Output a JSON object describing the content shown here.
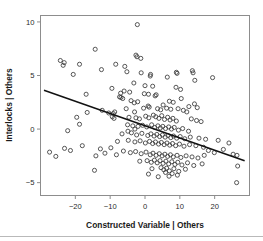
{
  "chart_data": {
    "type": "scatter",
    "title": "",
    "xlabel": "Constructed Variable | Others",
    "ylabel": "Interlocks | Others",
    "xlim": [
      -30,
      30
    ],
    "ylim": [
      -6.2,
      10.6
    ],
    "xticks": [
      -20,
      -10,
      0,
      10,
      20
    ],
    "xtick_labels": [
      "−20",
      "−10",
      "0",
      "10",
      "20"
    ],
    "yticks": [
      -5,
      0,
      5,
      10
    ],
    "ytick_labels": [
      "−5",
      "0",
      "5",
      "10"
    ],
    "grid": false,
    "legend": "none",
    "marker": "open-circle",
    "point_color": "#3a3a3a",
    "line_color": "#121212",
    "frame_color": "#8d8d8d",
    "fit_line": {
      "type": "linear",
      "label": "least-squares fit",
      "x_start": -29.0,
      "y_start": 3.62,
      "x_end": 28.6,
      "y_end": -2.95,
      "slope": -0.114,
      "intercept": 0.32
    },
    "points": [
      [
        -2.2,
        9.75
      ],
      [
        -14.3,
        7.45
      ],
      [
        -2.6,
        6.9
      ],
      [
        -2.3,
        6.75
      ],
      [
        -1.2,
        6.6
      ],
      [
        -24.3,
        6.4
      ],
      [
        -23.2,
        6.2
      ],
      [
        -18.8,
        6.05
      ],
      [
        -23.5,
        5.95
      ],
      [
        -8.4,
        6.05
      ],
      [
        -5.8,
        5.85
      ],
      [
        -12.5,
        5.55
      ],
      [
        -5.2,
        5.35
      ],
      [
        -20.6,
        5.1
      ],
      [
        -1.1,
        5.25
      ],
      [
        9.0,
        5.3
      ],
      [
        9.2,
        5.2
      ],
      [
        1.6,
        5.1
      ],
      [
        1.5,
        4.95
      ],
      [
        6.4,
        4.85
      ],
      [
        19.4,
        4.8
      ],
      [
        14.3,
        4.55
      ],
      [
        -3.2,
        4.3
      ],
      [
        -9.5,
        3.8
      ],
      [
        -16.9,
        3.25
      ],
      [
        -4.4,
        3.45
      ],
      [
        3.2,
        3.2
      ],
      [
        2.9,
        3.1
      ],
      [
        -7.3,
        3.0
      ],
      [
        -6.9,
        2.95
      ],
      [
        -6.4,
        2.85
      ],
      [
        -4.0,
        2.65
      ],
      [
        -2.1,
        2.55
      ],
      [
        -3.1,
        2.45
      ],
      [
        10.2,
        3.7
      ],
      [
        10.4,
        2.85
      ],
      [
        7.0,
        2.6
      ],
      [
        8.1,
        2.5
      ],
      [
        14.2,
        2.35
      ],
      [
        5.2,
        2.25
      ],
      [
        0.9,
        2.15
      ],
      [
        1.2,
        2.05
      ],
      [
        -0.4,
        1.95
      ],
      [
        -5.4,
        1.9
      ],
      [
        -12.3,
        1.75
      ],
      [
        -8.7,
        1.6
      ],
      [
        -9.1,
        1.45
      ],
      [
        -3.0,
        1.6
      ],
      [
        3.6,
        1.9
      ],
      [
        4.5,
        1.8
      ],
      [
        6.2,
        1.95
      ],
      [
        7.4,
        1.85
      ],
      [
        9.5,
        1.9
      ],
      [
        11.0,
        1.75
      ],
      [
        12.0,
        1.6
      ],
      [
        -19.6,
        1.1
      ],
      [
        -18.8,
        0.45
      ],
      [
        -22.2,
        -0.15
      ],
      [
        -10.4,
        1.5
      ],
      [
        -9.4,
        1.15
      ],
      [
        -8.9,
        1.0
      ],
      [
        -4.6,
        1.1
      ],
      [
        -2.6,
        1.05
      ],
      [
        -1.6,
        0.95
      ],
      [
        0.2,
        1.2
      ],
      [
        1.1,
        1.05
      ],
      [
        2.4,
        1.3
      ],
      [
        3.1,
        1.15
      ],
      [
        4.0,
        1.0
      ],
      [
        4.8,
        1.25
      ],
      [
        5.6,
        0.9
      ],
      [
        6.5,
        1.1
      ],
      [
        7.2,
        0.85
      ],
      [
        8.0,
        1.0
      ],
      [
        9.0,
        0.75
      ],
      [
        13.3,
        0.95
      ],
      [
        14.8,
        0.8
      ],
      [
        16.1,
        0.7
      ],
      [
        -5.0,
        0.4
      ],
      [
        -3.5,
        0.3
      ],
      [
        -2.0,
        0.25
      ],
      [
        -0.7,
        0.35
      ],
      [
        0.5,
        0.2
      ],
      [
        1.9,
        0.4
      ],
      [
        2.8,
        0.15
      ],
      [
        3.7,
        0.3
      ],
      [
        4.4,
        0.1
      ],
      [
        5.1,
        0.25
      ],
      [
        5.9,
        0.05
      ],
      [
        6.8,
        0.2
      ],
      [
        7.6,
        0.0
      ],
      [
        8.4,
        0.15
      ],
      [
        9.6,
        -0.1
      ],
      [
        10.8,
        0.05
      ],
      [
        12.5,
        -0.2
      ],
      [
        -6.6,
        -0.45
      ],
      [
        -3.9,
        -0.35
      ],
      [
        -2.4,
        -0.55
      ],
      [
        -0.9,
        -0.4
      ],
      [
        0.8,
        -0.6
      ],
      [
        1.7,
        -0.45
      ],
      [
        2.6,
        -0.65
      ],
      [
        3.4,
        -0.5
      ],
      [
        4.2,
        -0.7
      ],
      [
        5.0,
        -0.55
      ],
      [
        5.8,
        -0.75
      ],
      [
        6.6,
        -0.6
      ],
      [
        7.4,
        -0.8
      ],
      [
        8.2,
        -0.65
      ],
      [
        9.1,
        -0.85
      ],
      [
        10.1,
        -0.7
      ],
      [
        11.4,
        -0.9
      ],
      [
        13.0,
        -0.75
      ],
      [
        15.5,
        -0.85
      ],
      [
        17.4,
        -0.95
      ],
      [
        -7.9,
        -1.15
      ],
      [
        -4.8,
        -1.05
      ],
      [
        -2.9,
        -1.2
      ],
      [
        -1.4,
        -1.1
      ],
      [
        0.1,
        -1.3
      ],
      [
        1.3,
        -1.15
      ],
      [
        2.2,
        -1.35
      ],
      [
        3.0,
        -1.2
      ],
      [
        3.9,
        -1.4
      ],
      [
        4.7,
        -1.25
      ],
      [
        5.5,
        -1.45
      ],
      [
        6.3,
        -1.3
      ],
      [
        7.1,
        -1.5
      ],
      [
        7.9,
        -1.35
      ],
      [
        8.8,
        -1.55
      ],
      [
        9.9,
        -1.4
      ],
      [
        11.2,
        -1.6
      ],
      [
        12.8,
        -1.45
      ],
      [
        14.6,
        -1.55
      ],
      [
        16.8,
        -1.7
      ],
      [
        -27.4,
        -2.15
      ],
      [
        -25.6,
        -2.55
      ],
      [
        -23.1,
        -1.8
      ],
      [
        -21.4,
        -2.0
      ],
      [
        -18.0,
        -1.55
      ],
      [
        -14.1,
        -2.5
      ],
      [
        -12.8,
        -1.85
      ],
      [
        -9.8,
        -1.75
      ],
      [
        -8.2,
        -2.4
      ],
      [
        -6.2,
        -2.05
      ],
      [
        -4.2,
        -2.2
      ],
      [
        -2.7,
        -2.1
      ],
      [
        -1.1,
        -2.3
      ],
      [
        0.3,
        -2.15
      ],
      [
        1.5,
        -2.4
      ],
      [
        2.3,
        -2.25
      ],
      [
        3.2,
        -2.45
      ],
      [
        4.1,
        -2.3
      ],
      [
        4.9,
        -2.5
      ],
      [
        5.7,
        -2.35
      ],
      [
        6.5,
        -2.55
      ],
      [
        7.3,
        -2.4
      ],
      [
        8.1,
        -2.6
      ],
      [
        9.2,
        -2.45
      ],
      [
        10.3,
        -2.65
      ],
      [
        11.8,
        -2.5
      ],
      [
        13.5,
        -2.6
      ],
      [
        15.2,
        -2.7
      ],
      [
        17.0,
        -2.45
      ],
      [
        19.9,
        -2.2
      ],
      [
        25.3,
        -2.35
      ],
      [
        26.4,
        -2.45
      ],
      [
        -14.5,
        -3.85
      ],
      [
        -1.5,
        -3.0
      ],
      [
        0.6,
        -2.95
      ],
      [
        1.8,
        -3.1
      ],
      [
        2.7,
        -2.9
      ],
      [
        3.5,
        -3.15
      ],
      [
        4.3,
        -2.95
      ],
      [
        5.2,
        -3.2
      ],
      [
        6.0,
        -3.0
      ],
      [
        6.8,
        -3.25
      ],
      [
        7.7,
        -3.05
      ],
      [
        8.6,
        -3.3
      ],
      [
        9.4,
        -3.1
      ],
      [
        10.6,
        -3.35
      ],
      [
        12.2,
        -3.15
      ],
      [
        14.0,
        -3.4
      ],
      [
        16.4,
        -3.25
      ],
      [
        26.6,
        -3.45
      ],
      [
        24.1,
        -1.3
      ],
      [
        2.0,
        -3.7
      ],
      [
        4.6,
        -3.6
      ],
      [
        5.4,
        -3.8
      ],
      [
        6.2,
        -3.65
      ],
      [
        7.0,
        -3.9
      ],
      [
        8.3,
        -3.7
      ],
      [
        9.7,
        -3.95
      ],
      [
        11.6,
        -3.75
      ],
      [
        1.0,
        -4.2
      ],
      [
        5.9,
        -4.05
      ],
      [
        7.8,
        -4.15
      ],
      [
        9.3,
        -4.3
      ],
      [
        26.3,
        -5.0
      ],
      [
        3.8,
        -4.45
      ],
      [
        6.9,
        -4.4
      ],
      [
        -11.5,
        -2.25
      ],
      [
        -16.6,
        1.55
      ],
      [
        21.0,
        -1.05
      ],
      [
        22.5,
        -1.9
      ],
      [
        -6.0,
        3.55
      ],
      [
        -7.0,
        3.35
      ],
      [
        13.8,
        5.25
      ],
      [
        13.6,
        5.45
      ],
      [
        0.0,
        4.05
      ],
      [
        2.2,
        4.0
      ],
      [
        -0.2,
        3.3
      ],
      [
        1.0,
        3.25
      ],
      [
        8.9,
        3.9
      ],
      [
        12.6,
        2.1
      ],
      [
        15.0,
        2.0
      ],
      [
        18.2,
        -2.0
      ],
      [
        -2.9,
        0.0
      ],
      [
        -4.9,
        -0.2
      ]
    ]
  }
}
